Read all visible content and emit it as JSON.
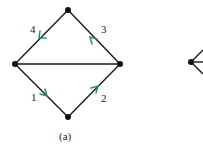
{
  "figure": {
    "caption": "(a)",
    "nodes": {
      "top": [
        68,
        10
      ],
      "left": [
        15,
        64
      ],
      "right": [
        120,
        64
      ],
      "bottom": [
        68,
        117
      ],
      "partial_right": [
        191,
        62
      ]
    },
    "edges": [
      {
        "from": "left",
        "to": "right",
        "directed": false
      },
      {
        "from": "left",
        "to": "bottom",
        "label": "1",
        "arrow": "toward-bottom"
      },
      {
        "from": "bottom",
        "to": "right",
        "label": "2",
        "arrow": "toward-right"
      },
      {
        "from": "right",
        "to": "top",
        "label": "3",
        "arrow": "toward-top"
      },
      {
        "from": "top",
        "to": "left",
        "label": "4",
        "arrow": "toward-left"
      }
    ],
    "labels": {
      "e1": "1",
      "e2": "2",
      "e3": "3",
      "e4": "4"
    },
    "colors": {
      "edge": "#1a1a1a",
      "arrow": "#2a8a8a",
      "node": "#111111"
    }
  }
}
